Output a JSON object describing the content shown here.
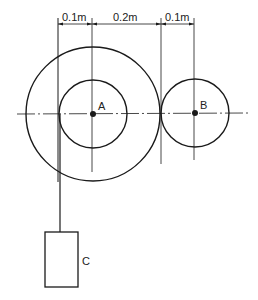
{
  "diagram": {
    "dimensions": [
      {
        "label": "0.1m",
        "from_x": 58,
        "to_x": 92
      },
      {
        "label": "0.2m",
        "from_x": 92,
        "to_x": 161
      },
      {
        "label": "0.1m",
        "from_x": 161,
        "to_x": 194
      }
    ],
    "points": {
      "a": {
        "label": "A",
        "x": 93,
        "y": 114
      },
      "b": {
        "label": "B",
        "x": 195,
        "y": 113
      }
    },
    "mass": {
      "label": "C"
    },
    "colors": {
      "line": "#1a1a1a",
      "background": "#ffffff"
    }
  }
}
